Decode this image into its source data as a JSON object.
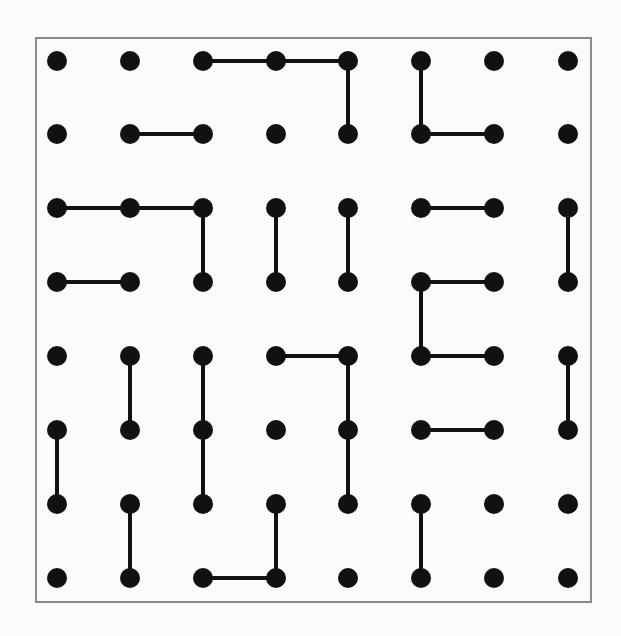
{
  "diagram": {
    "type": "dot-grid-line-puzzle",
    "rows": 8,
    "cols": 8,
    "colors": {
      "background": "#fbfbfa",
      "frame": "#8a8a8a",
      "dot": "#111111",
      "line": "#111111"
    },
    "frame": {
      "x": 36,
      "y": 38,
      "width": 555,
      "height": 564
    },
    "x_positions": [
      57,
      130,
      203,
      276,
      348,
      421,
      494,
      568
    ],
    "y_positions": [
      61,
      134,
      208,
      282,
      356,
      430,
      504,
      578
    ],
    "dot_radius": 10,
    "line_width": 4,
    "edges": [
      [
        [
          0,
          2
        ],
        [
          0,
          3
        ]
      ],
      [
        [
          0,
          3
        ],
        [
          0,
          4
        ]
      ],
      [
        [
          0,
          4
        ],
        [
          1,
          4
        ]
      ],
      [
        [
          0,
          5
        ],
        [
          1,
          5
        ]
      ],
      [
        [
          1,
          1
        ],
        [
          1,
          2
        ]
      ],
      [
        [
          1,
          5
        ],
        [
          1,
          6
        ]
      ],
      [
        [
          2,
          0
        ],
        [
          2,
          1
        ]
      ],
      [
        [
          2,
          1
        ],
        [
          2,
          2
        ]
      ],
      [
        [
          2,
          2
        ],
        [
          3,
          2
        ]
      ],
      [
        [
          2,
          3
        ],
        [
          3,
          3
        ]
      ],
      [
        [
          2,
          4
        ],
        [
          3,
          4
        ]
      ],
      [
        [
          2,
          5
        ],
        [
          2,
          6
        ]
      ],
      [
        [
          2,
          7
        ],
        [
          3,
          7
        ]
      ],
      [
        [
          3,
          0
        ],
        [
          3,
          1
        ]
      ],
      [
        [
          3,
          5
        ],
        [
          3,
          6
        ]
      ],
      [
        [
          3,
          5
        ],
        [
          4,
          5
        ]
      ],
      [
        [
          4,
          1
        ],
        [
          5,
          1
        ]
      ],
      [
        [
          4,
          2
        ],
        [
          5,
          2
        ]
      ],
      [
        [
          5,
          2
        ],
        [
          6,
          2
        ]
      ],
      [
        [
          4,
          3
        ],
        [
          4,
          4
        ]
      ],
      [
        [
          4,
          4
        ],
        [
          5,
          4
        ]
      ],
      [
        [
          5,
          4
        ],
        [
          6,
          4
        ]
      ],
      [
        [
          4,
          5
        ],
        [
          4,
          6
        ]
      ],
      [
        [
          4,
          7
        ],
        [
          5,
          7
        ]
      ],
      [
        [
          5,
          0
        ],
        [
          6,
          0
        ]
      ],
      [
        [
          5,
          5
        ],
        [
          5,
          6
        ]
      ],
      [
        [
          6,
          1
        ],
        [
          7,
          1
        ]
      ],
      [
        [
          6,
          3
        ],
        [
          7,
          3
        ]
      ],
      [
        [
          6,
          5
        ],
        [
          7,
          5
        ]
      ],
      [
        [
          7,
          2
        ],
        [
          7,
          3
        ]
      ]
    ]
  }
}
